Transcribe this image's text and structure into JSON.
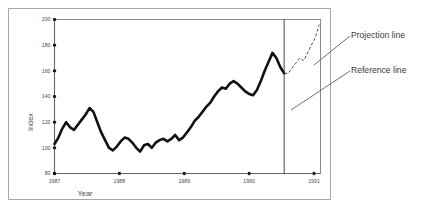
{
  "chart_data": {
    "type": "line",
    "title": "",
    "xlabel": "Year",
    "ylabel": "Index",
    "xlim": [
      1987.0,
      1991.1
    ],
    "ylim": [
      80,
      200
    ],
    "grid": false,
    "legend": "none",
    "y_ticks": [
      80,
      100,
      120,
      140,
      160,
      180,
      200
    ],
    "x_ticks": [
      1987,
      1988,
      1989,
      1990,
      1991
    ],
    "x_tick_labels": [
      "1987",
      "1988",
      "1989",
      "1990",
      "1991"
    ],
    "y_tick_labels": [
      "80",
      "100",
      "120",
      "140",
      "160",
      "180",
      "200"
    ],
    "series": [
      {
        "name": "Index",
        "style": "solid-thick",
        "x": [
          1987.0,
          1987.06,
          1987.12,
          1987.18,
          1987.24,
          1987.3,
          1987.36,
          1987.42,
          1987.48,
          1987.54,
          1987.6,
          1987.66,
          1987.72,
          1987.78,
          1987.84,
          1987.9,
          1987.96,
          1988.02,
          1988.08,
          1988.14,
          1988.2,
          1988.26,
          1988.32,
          1988.38,
          1988.44,
          1988.5,
          1988.56,
          1988.62,
          1988.68,
          1988.74,
          1988.8,
          1988.86,
          1988.92,
          1988.98,
          1989.04,
          1989.1,
          1989.16,
          1989.22,
          1989.28,
          1989.34,
          1989.4,
          1989.46,
          1989.52,
          1989.58,
          1989.64,
          1989.7,
          1989.76,
          1989.82,
          1989.88,
          1989.94,
          1990.0,
          1990.06,
          1990.12,
          1990.18,
          1990.24,
          1990.3,
          1990.36,
          1990.42,
          1990.48,
          1990.54
        ],
        "y": [
          103,
          108,
          115,
          120,
          116,
          114,
          118,
          122,
          126,
          131,
          128,
          120,
          112,
          106,
          100,
          98,
          101,
          105,
          108,
          107,
          104,
          100,
          97,
          102,
          103,
          100,
          104,
          106,
          107,
          105,
          107,
          110,
          106,
          108,
          112,
          116,
          121,
          124,
          128,
          132,
          135,
          140,
          144,
          147,
          146,
          150,
          152,
          150,
          147,
          144,
          142,
          141,
          145,
          152,
          160,
          167,
          174,
          170,
          163,
          158
        ]
      },
      {
        "name": "Projection",
        "style": "dashed-thin",
        "x": [
          1990.54,
          1990.6,
          1990.66,
          1990.72,
          1990.78,
          1990.84,
          1990.9,
          1990.96,
          1991.02,
          1991.08
        ],
        "y": [
          158,
          158,
          162,
          166,
          170,
          168,
          174,
          180,
          186,
          196
        ]
      }
    ],
    "reference_line": {
      "orientation": "vertical",
      "x": 1990.54,
      "label": "Reference line"
    },
    "annotations": [
      {
        "id": "projection-callout",
        "text": "Projection line"
      },
      {
        "id": "reference-callout",
        "text": "Reference line"
      }
    ]
  },
  "colors": {
    "series_main": "#111111",
    "series_projection": "#3a3a3a",
    "reference": "#333333",
    "axis": "#666666",
    "frame": "#a8a8a8",
    "text": "#3a3a3a",
    "background": "#ffffff"
  }
}
